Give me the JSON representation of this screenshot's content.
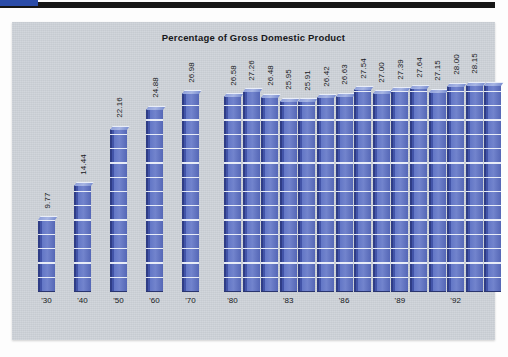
{
  "header": {
    "rule_color": "#161616",
    "accent_color": "#2b4ca8"
  },
  "panel": {
    "background_color": "#cdd2d8"
  },
  "chart_data": {
    "type": "bar",
    "title": "Percentage of Gross Domestic Product",
    "xlabel": "",
    "ylabel": "",
    "ylim": [
      0,
      30
    ],
    "grid": false,
    "legend": null,
    "bar_color": "#5c6fbe",
    "bar_edge_color": "#2f3d86",
    "bar_top_color": "#a8b6e4",
    "label_rotation": -90,
    "categories": [
      "'30",
      "'40",
      "'50",
      "'60",
      "'70",
      "'80",
      "'81",
      "'82",
      "'83",
      "'84",
      "'85",
      "'86",
      "'87",
      "'88",
      "'89",
      "'90",
      "'91",
      "'92",
      "'93",
      "'94"
    ],
    "tick_labels": [
      "'30",
      "'40",
      "'50",
      "'60",
      "'70",
      "'80",
      "'83",
      "'86",
      "'89",
      "'92"
    ],
    "tick_indices": [
      0,
      1,
      2,
      3,
      4,
      5,
      8,
      11,
      14,
      17
    ],
    "values": [
      9.77,
      14.44,
      22.16,
      24.88,
      26.98,
      26.58,
      27.26,
      26.48,
      25.95,
      25.91,
      26.42,
      26.63,
      27.54,
      27.0,
      27.39,
      27.64,
      27.15,
      28.0,
      28.15,
      28.15
    ],
    "data_labels": [
      "9.77",
      "14.44",
      "22.16",
      "24.88",
      "26.98",
      "26.58",
      "27.26",
      "26.48",
      "25.95",
      "25.91",
      "26.42",
      "26.63",
      "27.54",
      "27.00",
      "27.39",
      "27.64",
      "27.15",
      "28.00",
      "28.15",
      ""
    ],
    "groups": [
      {
        "name": "decades",
        "indices": [
          0,
          1,
          2,
          3,
          4
        ],
        "spacing": "wide"
      },
      {
        "name": "annual",
        "indices": [
          5,
          6,
          7,
          8,
          9,
          10,
          11,
          12,
          13,
          14,
          15,
          16,
          17,
          18,
          19
        ],
        "spacing": "tight"
      }
    ]
  }
}
